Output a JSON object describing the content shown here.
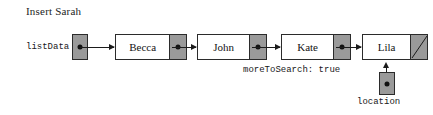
{
  "diagram": {
    "title": "Insert Sarah",
    "colors": {
      "background": "#ffffff",
      "node_fill": "#ffffff",
      "pointer_fill": "#9a9a9a",
      "stroke": "#2b2b2b",
      "arrow": "#1b1b1b",
      "text": "#131313"
    },
    "head_pointer": {
      "label": "listData",
      "value_icon": "pointer-dot-icon"
    },
    "nodes": [
      {
        "data": "Becca",
        "link": "pointer-dot-icon"
      },
      {
        "data": "John",
        "link": "pointer-dot-icon"
      },
      {
        "data": "Kate",
        "link": "pointer-dot-icon"
      },
      {
        "data": "Lila",
        "link": "null-pointer-slash-icon"
      }
    ],
    "status": {
      "label": "moreToSearch: true"
    },
    "location_pointer": {
      "label": "location",
      "value_icon": "pointer-dot-icon"
    }
  }
}
